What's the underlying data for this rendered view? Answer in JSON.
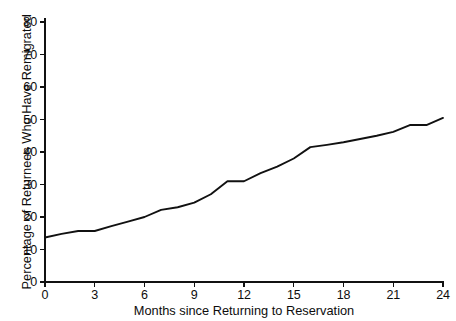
{
  "chart_data": {
    "type": "line",
    "title": "",
    "xlabel": "Months since Returning to Reservation",
    "ylabel": "Percentage of Returnees Who Have Remigrated",
    "xlim": [
      0,
      24
    ],
    "ylim": [
      0,
      80
    ],
    "xticks": [
      0,
      3,
      6,
      9,
      12,
      15,
      18,
      21,
      24
    ],
    "yticks": [
      0,
      10,
      20,
      30,
      40,
      50,
      60,
      70,
      80
    ],
    "xtick_labels": [
      "0",
      "3",
      "6",
      "9",
      "12",
      "15",
      "18",
      "21",
      "24"
    ],
    "ytick_labels": [
      "0",
      "10",
      "20",
      "30",
      "40",
      "50",
      "60",
      "70",
      "80"
    ],
    "grid": false,
    "legend": false,
    "legend_position": "none",
    "line_color": "#111111",
    "background_color": "#ffffff",
    "series": [
      {
        "name": "Percentage remigrated",
        "x": [
          0,
          1,
          2,
          3,
          4,
          5,
          6,
          7,
          8,
          9,
          10,
          11,
          12,
          13,
          14,
          15,
          16,
          17,
          18,
          19,
          20,
          21,
          22,
          23,
          24
        ],
        "values": [
          13.7,
          14.8,
          15.7,
          15.7,
          17.2,
          18.6,
          20.0,
          22.2,
          23.0,
          24.4,
          27.0,
          31.0,
          31.0,
          33.5,
          35.5,
          38.0,
          41.5,
          42.2,
          43.0,
          44.0,
          45.0,
          46.2,
          48.3,
          48.3,
          50.5
        ]
      }
    ]
  }
}
